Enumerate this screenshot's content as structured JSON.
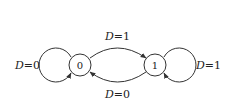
{
  "diagram": {
    "type": "state-transition",
    "states": [
      {
        "id": "s0",
        "label": "0"
      },
      {
        "id": "s1",
        "label": "1"
      }
    ],
    "transitions": [
      {
        "from": "0",
        "to": "0",
        "var": "D",
        "eq": "=",
        "value": "0"
      },
      {
        "from": "0",
        "to": "1",
        "var": "D",
        "eq": "=",
        "value": "1"
      },
      {
        "from": "1",
        "to": "0",
        "var": "D",
        "eq": "=",
        "value": "0"
      },
      {
        "from": "1",
        "to": "1",
        "var": "D",
        "eq": "=",
        "value": "1"
      }
    ],
    "colors": {
      "stroke": "#333333",
      "text": "#222222",
      "background": "#ffffff"
    }
  }
}
